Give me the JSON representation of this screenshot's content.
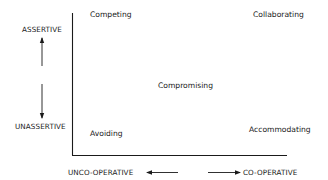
{
  "diagram": {
    "vertical_axis": {
      "top_label": "ASSERTIVE",
      "bottom_label": "UNASSERTIVE"
    },
    "horizontal_axis": {
      "left_label": "UNCO-OPERATIVE",
      "right_label": "CO-OPERATIVE"
    },
    "modes": {
      "top_left": "Competing",
      "top_right": "Collaborating",
      "center": "Compromising",
      "bottom_left": "Avoiding",
      "bottom_right": "Accommodating"
    },
    "icons": {
      "up": "arrow-up-icon",
      "down": "arrow-down-icon",
      "left": "arrow-left-icon",
      "right": "arrow-right-icon"
    },
    "colors": {
      "ink": "#1a1a1a",
      "background": "#ffffff"
    }
  }
}
